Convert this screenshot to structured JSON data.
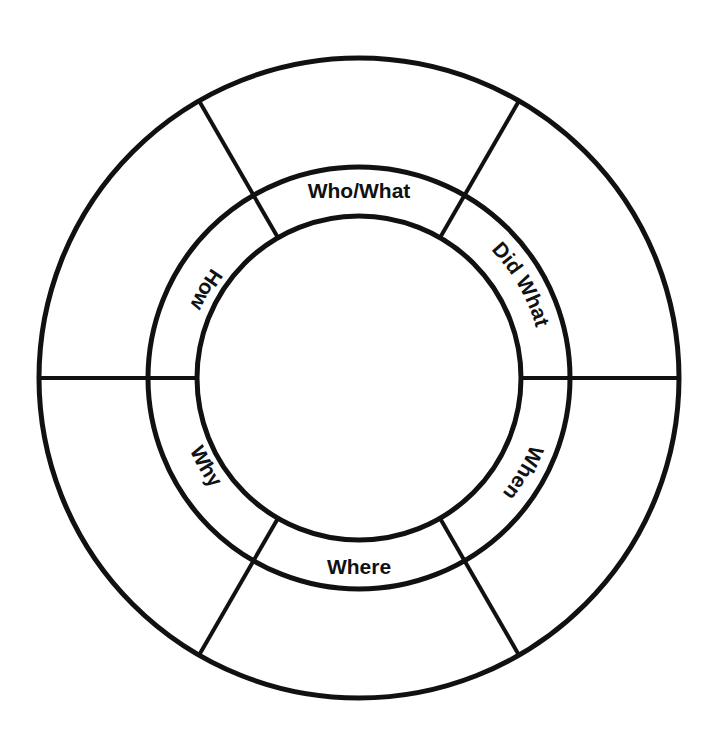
{
  "diagram": {
    "type": "concentric-ring-segmented-wheel",
    "background_color": "#ffffff",
    "stroke_color": "#111111",
    "text_color": "#111111",
    "geometry": {
      "center_x": 359,
      "center_y": 378,
      "inner_circle_radius": 162,
      "middle_circle_radius": 211,
      "outer_circle_radius": 320,
      "inner_ring_stroke_width": 5,
      "middle_ring_stroke_width": 5,
      "outer_ring_stroke_width": 5,
      "divider_stroke_width": 4
    },
    "rings": [
      {
        "name": "inner-hub",
        "label": ""
      },
      {
        "name": "label-ring",
        "label": ""
      },
      {
        "name": "outer-answer-ring",
        "label": ""
      }
    ],
    "segments": [
      {
        "id": "who-what",
        "label": "Who/What",
        "start_angle": 60,
        "end_angle": 120,
        "text_angle": 90,
        "orientation": "upright"
      },
      {
        "id": "did-what",
        "label": "Did What",
        "start_angle": 0,
        "end_angle": 60,
        "text_angle": 30,
        "orientation": "curved"
      },
      {
        "id": "when",
        "label": "When",
        "start_angle": 300,
        "end_angle": 360,
        "text_angle": 330,
        "orientation": "curved"
      },
      {
        "id": "where",
        "label": "Where",
        "start_angle": 240,
        "end_angle": 300,
        "text_angle": 270,
        "orientation": "upright"
      },
      {
        "id": "why",
        "label": "Why",
        "start_angle": 180,
        "end_angle": 240,
        "text_angle": 210,
        "orientation": "curved"
      },
      {
        "id": "how",
        "label": "How",
        "start_angle": 120,
        "end_angle": 180,
        "text_angle": 150,
        "orientation": "curved"
      }
    ],
    "divider_angles_degrees": [
      0,
      60,
      120,
      180,
      240,
      300
    ]
  }
}
